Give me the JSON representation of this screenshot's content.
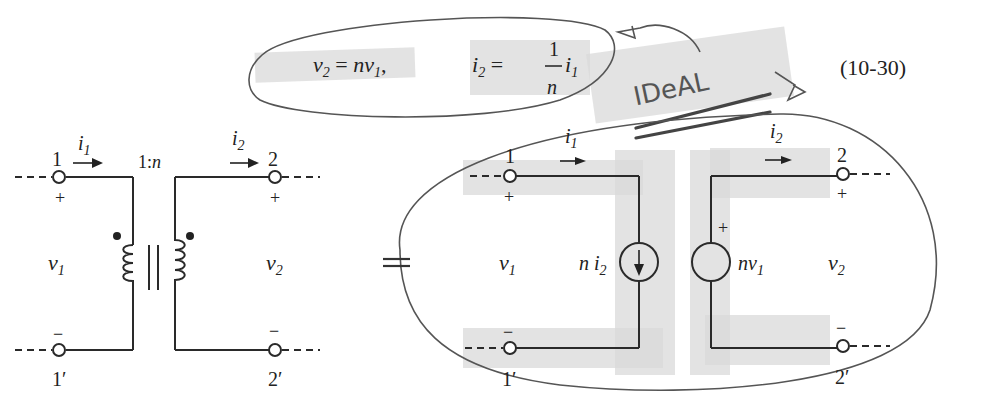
{
  "equation": {
    "lhs1": "v",
    "lhs1_sub": "2",
    "rel1": "= nv",
    "rel1_sub": "1",
    "sep": ",",
    "lhs2": "i",
    "lhs2_sub": "2",
    "rel2": "=",
    "frac_num": "1",
    "frac_den": "n",
    "rhs2": "i",
    "rhs2_sub": "1",
    "number": "(10-30)"
  },
  "annotation": {
    "handwritten": "IDeAL"
  },
  "left_circuit": {
    "terminal_1": "1",
    "terminal_1p": "1′",
    "terminal_2": "2",
    "terminal_2p": "2′",
    "current_1": "i",
    "current_1_sub": "1",
    "current_2": "i",
    "current_2_sub": "2",
    "ratio": "1:n",
    "voltage_1": "v",
    "voltage_1_sub": "1",
    "voltage_2": "v",
    "voltage_2_sub": "2",
    "plus": "+",
    "minus": "−"
  },
  "equals": "=",
  "right_circuit": {
    "terminal_1": "1",
    "terminal_1p": "1′",
    "terminal_2": "2",
    "terminal_2p": "2′",
    "current_1": "i",
    "current_1_sub": "1",
    "current_2": "i",
    "current_2_sub": "2",
    "voltage_1": "v",
    "voltage_1_sub": "1",
    "voltage_2": "v",
    "voltage_2_sub": "2",
    "current_source_label": "n i",
    "current_source_sub": "2",
    "voltage_source_label": "nv",
    "voltage_source_sub": "1",
    "plus": "+",
    "minus": "−"
  }
}
